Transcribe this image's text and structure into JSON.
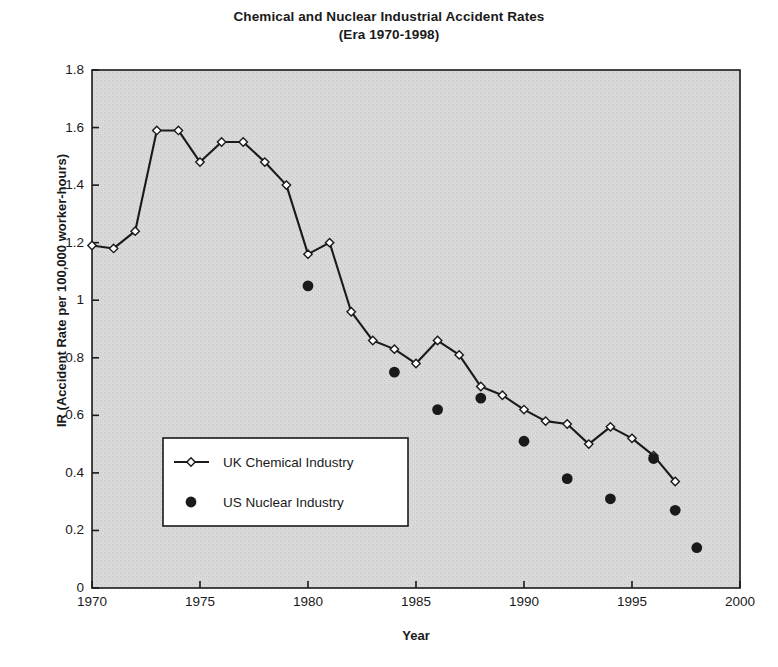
{
  "chart_data": {
    "type": "line",
    "title": "Chemical and Nuclear Industrial Accident Rates",
    "subtitle": "(Era 1970-1998)",
    "xlabel": "Year",
    "ylabel": "IR (Accident Rate per 100,000 worker-hours)",
    "xlim": [
      1970,
      2000
    ],
    "ylim": [
      0,
      1.8
    ],
    "xticks": [
      "1970",
      "1975",
      "1980",
      "1985",
      "1990",
      "1995",
      "2000"
    ],
    "xtick_values": [
      1970,
      1975,
      1980,
      1985,
      1990,
      1995,
      2000
    ],
    "yticks": [
      "0",
      "0.2",
      "0.4",
      "0.6",
      "0.8",
      "1",
      "1.2",
      "1.4",
      "1.6",
      "1.8"
    ],
    "ytick_values": [
      0,
      0.2,
      0.4,
      0.6,
      0.8,
      1.0,
      1.2,
      1.4,
      1.6,
      1.8
    ],
    "grid": false,
    "legend_position": "center-left-inside",
    "plot_background": "#d9d9d9",
    "series": [
      {
        "name": "UK Chemical Industry",
        "marker": "open-diamond",
        "style": "line-with-markers",
        "color": "#1a1a1a",
        "x": [
          1970,
          1971,
          1972,
          1973,
          1974,
          1975,
          1976,
          1977,
          1978,
          1979,
          1980,
          1981,
          1982,
          1983,
          1984,
          1985,
          1986,
          1987,
          1988,
          1989,
          1990,
          1991,
          1992,
          1993,
          1994,
          1995,
          1996,
          1997
        ],
        "values": [
          1.19,
          1.18,
          1.24,
          1.59,
          1.59,
          1.48,
          1.55,
          1.55,
          1.48,
          1.4,
          1.16,
          1.2,
          0.96,
          0.86,
          0.83,
          0.78,
          0.86,
          0.81,
          0.7,
          0.67,
          0.62,
          0.58,
          0.57,
          0.5,
          0.56,
          0.52,
          0.46,
          0.37
        ]
      },
      {
        "name": "US Nuclear Industry",
        "marker": "filled-circle",
        "style": "markers-only",
        "color": "#1a1a1a",
        "x": [
          1980,
          1984,
          1986,
          1988,
          1990,
          1992,
          1994,
          1996,
          1997,
          1998
        ],
        "values": [
          1.05,
          0.75,
          0.62,
          0.66,
          0.51,
          0.38,
          0.31,
          0.45,
          0.27,
          0.14
        ]
      }
    ]
  },
  "legend": {
    "items": [
      {
        "label": "UK Chemical Industry",
        "marker": "open-diamond"
      },
      {
        "label": "US Nuclear Industry",
        "marker": "filled-circle"
      }
    ]
  }
}
